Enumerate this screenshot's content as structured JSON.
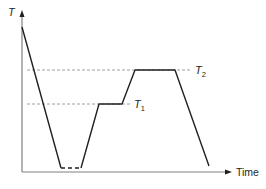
{
  "diagram": {
    "y_axis_label": "T",
    "x_axis_label": "Time",
    "levels": [
      {
        "name": "T",
        "subscript": "1",
        "y": 104
      },
      {
        "name": "T",
        "subscript": "2",
        "y": 70
      }
    ],
    "line_color": "#231f20",
    "axis_color": "#7f7f7f",
    "dash_color": "#9d9d9d"
  }
}
